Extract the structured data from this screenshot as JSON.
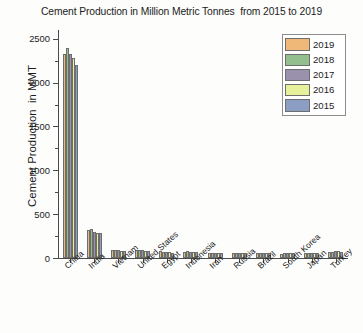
{
  "chart_data": {
    "type": "bar",
    "title": "Cement Production in Million Metric Tonnes  from 2015 to 2019",
    "xlabel": "",
    "ylabel": "Cement Production  in MMT",
    "ylim": [
      0,
      2600
    ],
    "yticks": [
      0,
      500,
      1000,
      1500,
      2000,
      2500
    ],
    "ytick_labels": [
      "0",
      "500",
      "1000",
      "1500",
      "2000",
      "2500"
    ],
    "grid": false,
    "legend_position": "upper right",
    "categories": [
      "China",
      "India",
      "Vietnam",
      "United States",
      "Egypt",
      "Indonesia",
      "Iran",
      "Russia",
      "Brazil",
      "South Korea",
      "Japan",
      "Turkey"
    ],
    "series": [
      {
        "name": "2019",
        "color": "#f0b878",
        "values": [
          2330,
          320,
          95,
          89,
          76,
          74,
          60,
          58,
          55,
          51,
          54,
          70
        ]
      },
      {
        "name": "2018",
        "color": "#93bf8f",
        "values": [
          2400,
          330,
          92,
          88,
          74,
          75,
          58,
          56,
          53,
          57,
          56,
          73
        ]
      },
      {
        "name": "2017",
        "color": "#9a91ad",
        "values": [
          2330,
          298,
          88,
          86,
          71,
          70,
          56,
          55,
          54,
          57,
          55,
          80
        ]
      },
      {
        "name": "2016",
        "color": "#e7f09a",
        "values": [
          2280,
          290,
          85,
          84,
          68,
          67,
          55,
          55,
          57,
          57,
          56,
          77
        ]
      },
      {
        "name": "2015",
        "color": "#8d9ec4",
        "values": [
          2200,
          283,
          80,
          83,
          62,
          65,
          54,
          62,
          62,
          58,
          55,
          72
        ]
      }
    ]
  },
  "legend": {
    "items": [
      {
        "label": "2019",
        "color": "#f0b878"
      },
      {
        "label": "2018",
        "color": "#93bf8f"
      },
      {
        "label": "2017",
        "color": "#9a91ad"
      },
      {
        "label": "2016",
        "color": "#e7f09a"
      },
      {
        "label": "2015",
        "color": "#8d9ec4"
      }
    ]
  }
}
